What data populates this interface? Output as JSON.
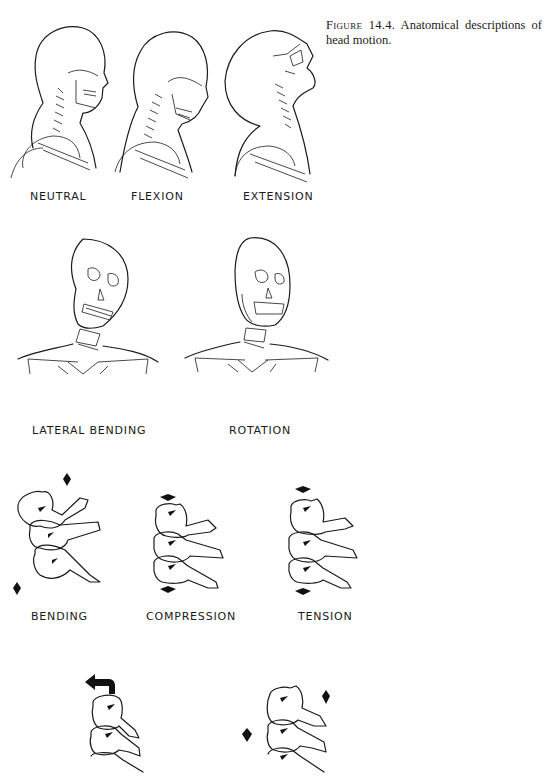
{
  "caption": {
    "figure_label": "Figure 14.4.",
    "text": " Anatomical descriptions of head motion."
  },
  "row1": {
    "items": [
      {
        "label": "NEUTRAL"
      },
      {
        "label": "FLEXION"
      },
      {
        "label": "EXTENSION"
      }
    ]
  },
  "row2": {
    "items": [
      {
        "label": "LATERAL  BENDING"
      },
      {
        "label": "ROTATION"
      }
    ]
  },
  "row3": {
    "items": [
      {
        "label": "BENDING"
      },
      {
        "label": "COMPRESSION"
      },
      {
        "label": "TENSION"
      }
    ]
  },
  "row4": {
    "items": [
      {
        "label": "TORSION",
        "visible": false
      },
      {
        "label": "SHEAR",
        "visible": false
      }
    ]
  }
}
